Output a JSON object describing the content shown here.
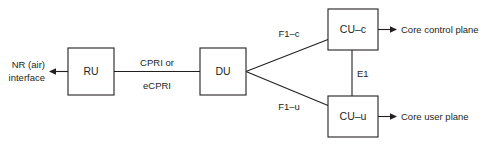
{
  "diagram": {
    "background_color": "#ffffff",
    "stroke_color": "#231f20",
    "nodes": [
      {
        "id": "ru",
        "label": "RU",
        "x": 68,
        "y": 48,
        "w": 46,
        "h": 47
      },
      {
        "id": "du",
        "label": "DU",
        "x": 200,
        "y": 48,
        "w": 46,
        "h": 47
      },
      {
        "id": "cu_c",
        "label": "CU–c",
        "x": 328,
        "y": 9,
        "w": 50,
        "h": 41
      },
      {
        "id": "cu_u",
        "label": "CU–u",
        "x": 328,
        "y": 96,
        "w": 50,
        "h": 41
      }
    ],
    "edges": [
      {
        "id": "air",
        "label_line1": "NR (air)",
        "label_line2": "interface",
        "arrow": "left"
      },
      {
        "id": "fronthaul",
        "label_line1": "CPRI or",
        "label_line2": "eCPRI",
        "arrow": "none"
      },
      {
        "id": "f1c",
        "label_line1": "F1–c",
        "label_line2": "",
        "arrow": "none"
      },
      {
        "id": "f1u",
        "label_line1": "F1–u",
        "label_line2": "",
        "arrow": "none"
      },
      {
        "id": "e1",
        "label_line1": "E1",
        "label_line2": "",
        "arrow": "none"
      },
      {
        "id": "core_c",
        "label_line1": "Core control plane",
        "label_line2": "",
        "arrow": "right"
      },
      {
        "id": "core_u",
        "label_line1": "Core user plane",
        "label_line2": "",
        "arrow": "right"
      }
    ]
  }
}
